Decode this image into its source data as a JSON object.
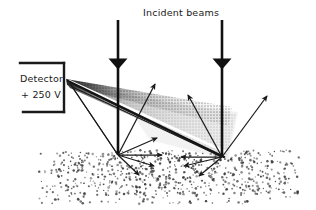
{
  "figure": {
    "width": 316,
    "height": 210,
    "background": "#ffffff",
    "ink_color": "#1a1a1a",
    "type": "scientific-schematic"
  },
  "labels": {
    "incident_beams": "Incident beams",
    "detector_name": "Detector",
    "detector_voltage": "+ 250 V"
  },
  "detector": {
    "bracket": {
      "top_line": {
        "x1": 20,
        "y1": 63,
        "x2": 64,
        "y2": 63
      },
      "right_line": {
        "x1": 64,
        "y1": 63,
        "x2": 64,
        "y2": 112
      },
      "bottom_line": {
        "x1": 23,
        "y1": 112,
        "x2": 64,
        "y2": 112
      },
      "stroke_width": 2.4
    },
    "tip": {
      "x": 66,
      "y": 80
    }
  },
  "incident_beams": [
    {
      "name": "left-incident-beam",
      "x": 118,
      "y_start": 20,
      "y_end": 155,
      "barb_y": 63,
      "stroke_width": 2.6
    },
    {
      "name": "right-incident-beam",
      "x": 222,
      "y_start": 20,
      "y_end": 157,
      "barb_y": 63,
      "stroke_width": 2.6
    }
  ],
  "impact_points": [
    {
      "name": "left-impact-point",
      "x": 118,
      "y": 155
    },
    {
      "name": "right-impact-point",
      "x": 222,
      "y": 157
    }
  ],
  "acceptance_cone": {
    "description": "shaded scattering acceptance cone from detector tip",
    "dark_color": "#2e2e2e",
    "mid_color": "#8c8c8c",
    "light_color": "#d6d6d6",
    "apex": {
      "x": 66,
      "y": 80
    },
    "upper_edge": {
      "x": 230,
      "y": 110
    },
    "lower_edge": {
      "x": 225,
      "y": 158
    }
  },
  "detector_axis_line": {
    "name": "detector-axis",
    "x1": 68,
    "y1": 81,
    "x2": 224,
    "y2": 157,
    "stroke_width": 2.2
  },
  "collection_rays": [
    {
      "name": "collection-ray-left-1",
      "x1": 118,
      "y1": 155,
      "x2": 68,
      "y2": 81
    },
    {
      "name": "collection-ray-left-2",
      "x1": 118,
      "y1": 155,
      "x2": 70,
      "y2": 84
    },
    {
      "name": "collection-ray-right-1",
      "x1": 222,
      "y1": 157,
      "x2": 68,
      "y2": 82
    },
    {
      "name": "collection-ray-right-2",
      "x1": 222,
      "y1": 157,
      "x2": 71,
      "y2": 86
    }
  ],
  "scatter_arrows": [
    {
      "name": "scatter-arrow-left-up-right",
      "x1": 118,
      "y1": 155,
      "x2": 155,
      "y2": 83
    },
    {
      "name": "scatter-arrow-left-diag-1",
      "x1": 118,
      "y1": 155,
      "x2": 158,
      "y2": 138
    },
    {
      "name": "scatter-arrow-left-horizontal",
      "x1": 118,
      "y1": 155,
      "x2": 163,
      "y2": 155
    },
    {
      "name": "scatter-arrow-left-diag-2",
      "x1": 118,
      "y1": 155,
      "x2": 155,
      "y2": 166
    },
    {
      "name": "scatter-arrow-left-down",
      "x1": 118,
      "y1": 155,
      "x2": 140,
      "y2": 175
    },
    {
      "name": "scatter-arrow-right-up-left",
      "x1": 222,
      "y1": 157,
      "x2": 188,
      "y2": 94
    },
    {
      "name": "scatter-arrow-right-up-right",
      "x1": 222,
      "y1": 157,
      "x2": 268,
      "y2": 95
    },
    {
      "name": "scatter-arrow-right-horizontal",
      "x1": 222,
      "y1": 157,
      "x2": 180,
      "y2": 157
    },
    {
      "name": "scatter-arrow-right-diag-left",
      "x1": 222,
      "y1": 157,
      "x2": 183,
      "y2": 166
    },
    {
      "name": "scatter-arrow-right-down-left",
      "x1": 222,
      "y1": 157,
      "x2": 198,
      "y2": 176
    }
  ],
  "substrate": {
    "name": "stippled-substrate",
    "description": "random dot stipple representing sample surface",
    "x": 38,
    "y": 150,
    "width": 262,
    "height": 54,
    "dot_color": "#3a3a3a",
    "dot_count": 900
  }
}
